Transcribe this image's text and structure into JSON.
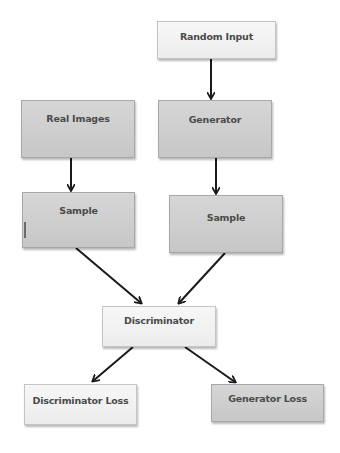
{
  "diagram": {
    "type": "flowchart",
    "title": "",
    "nodes": [
      {
        "id": "random_input",
        "label": "Random Input",
        "style": "light"
      },
      {
        "id": "real_images",
        "label": "Real Images",
        "style": "dark"
      },
      {
        "id": "generator",
        "label": "Generator",
        "style": "dark"
      },
      {
        "id": "sample_real",
        "label": "Sample",
        "style": "dark"
      },
      {
        "id": "sample_fake",
        "label": "Sample",
        "style": "dark"
      },
      {
        "id": "discriminator",
        "label": "Discriminator",
        "style": "light"
      },
      {
        "id": "discriminator_loss",
        "label": "Discriminator Loss",
        "style": "light"
      },
      {
        "id": "generator_loss",
        "label": "Generator Loss",
        "style": "dark"
      }
    ],
    "edges": [
      {
        "from": "random_input",
        "to": "generator"
      },
      {
        "from": "real_images",
        "to": "sample_real"
      },
      {
        "from": "generator",
        "to": "sample_fake"
      },
      {
        "from": "sample_real",
        "to": "discriminator"
      },
      {
        "from": "sample_fake",
        "to": "discriminator"
      },
      {
        "from": "discriminator",
        "to": "discriminator_loss"
      },
      {
        "from": "discriminator",
        "to": "generator_loss"
      }
    ]
  },
  "colors": {
    "light_box": "#f2f2f2",
    "dark_box": "#cfcfcf",
    "text": "#4a4a4a",
    "arrow": "#1a1a1a"
  }
}
